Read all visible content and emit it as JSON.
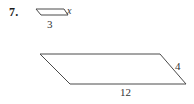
{
  "page": {
    "background_color": "#ffffff",
    "stroke_color": "#4a4a4a",
    "text_color": "#1a1a1a"
  },
  "problem": {
    "number": "7."
  },
  "figures": [
    {
      "name": "small-parallelogram",
      "labels": {
        "side_right": "x",
        "side_bottom": "3"
      },
      "points": "36,9 64,9 68,15 41,15"
    },
    {
      "name": "large-parallelogram",
      "labels": {
        "side_right": "4",
        "side_bottom": "12"
      },
      "points": "40,54 160,54 186,84 70,84"
    }
  ],
  "labels": {
    "x": "x",
    "three": "3",
    "four": "4",
    "twelve": "12"
  }
}
